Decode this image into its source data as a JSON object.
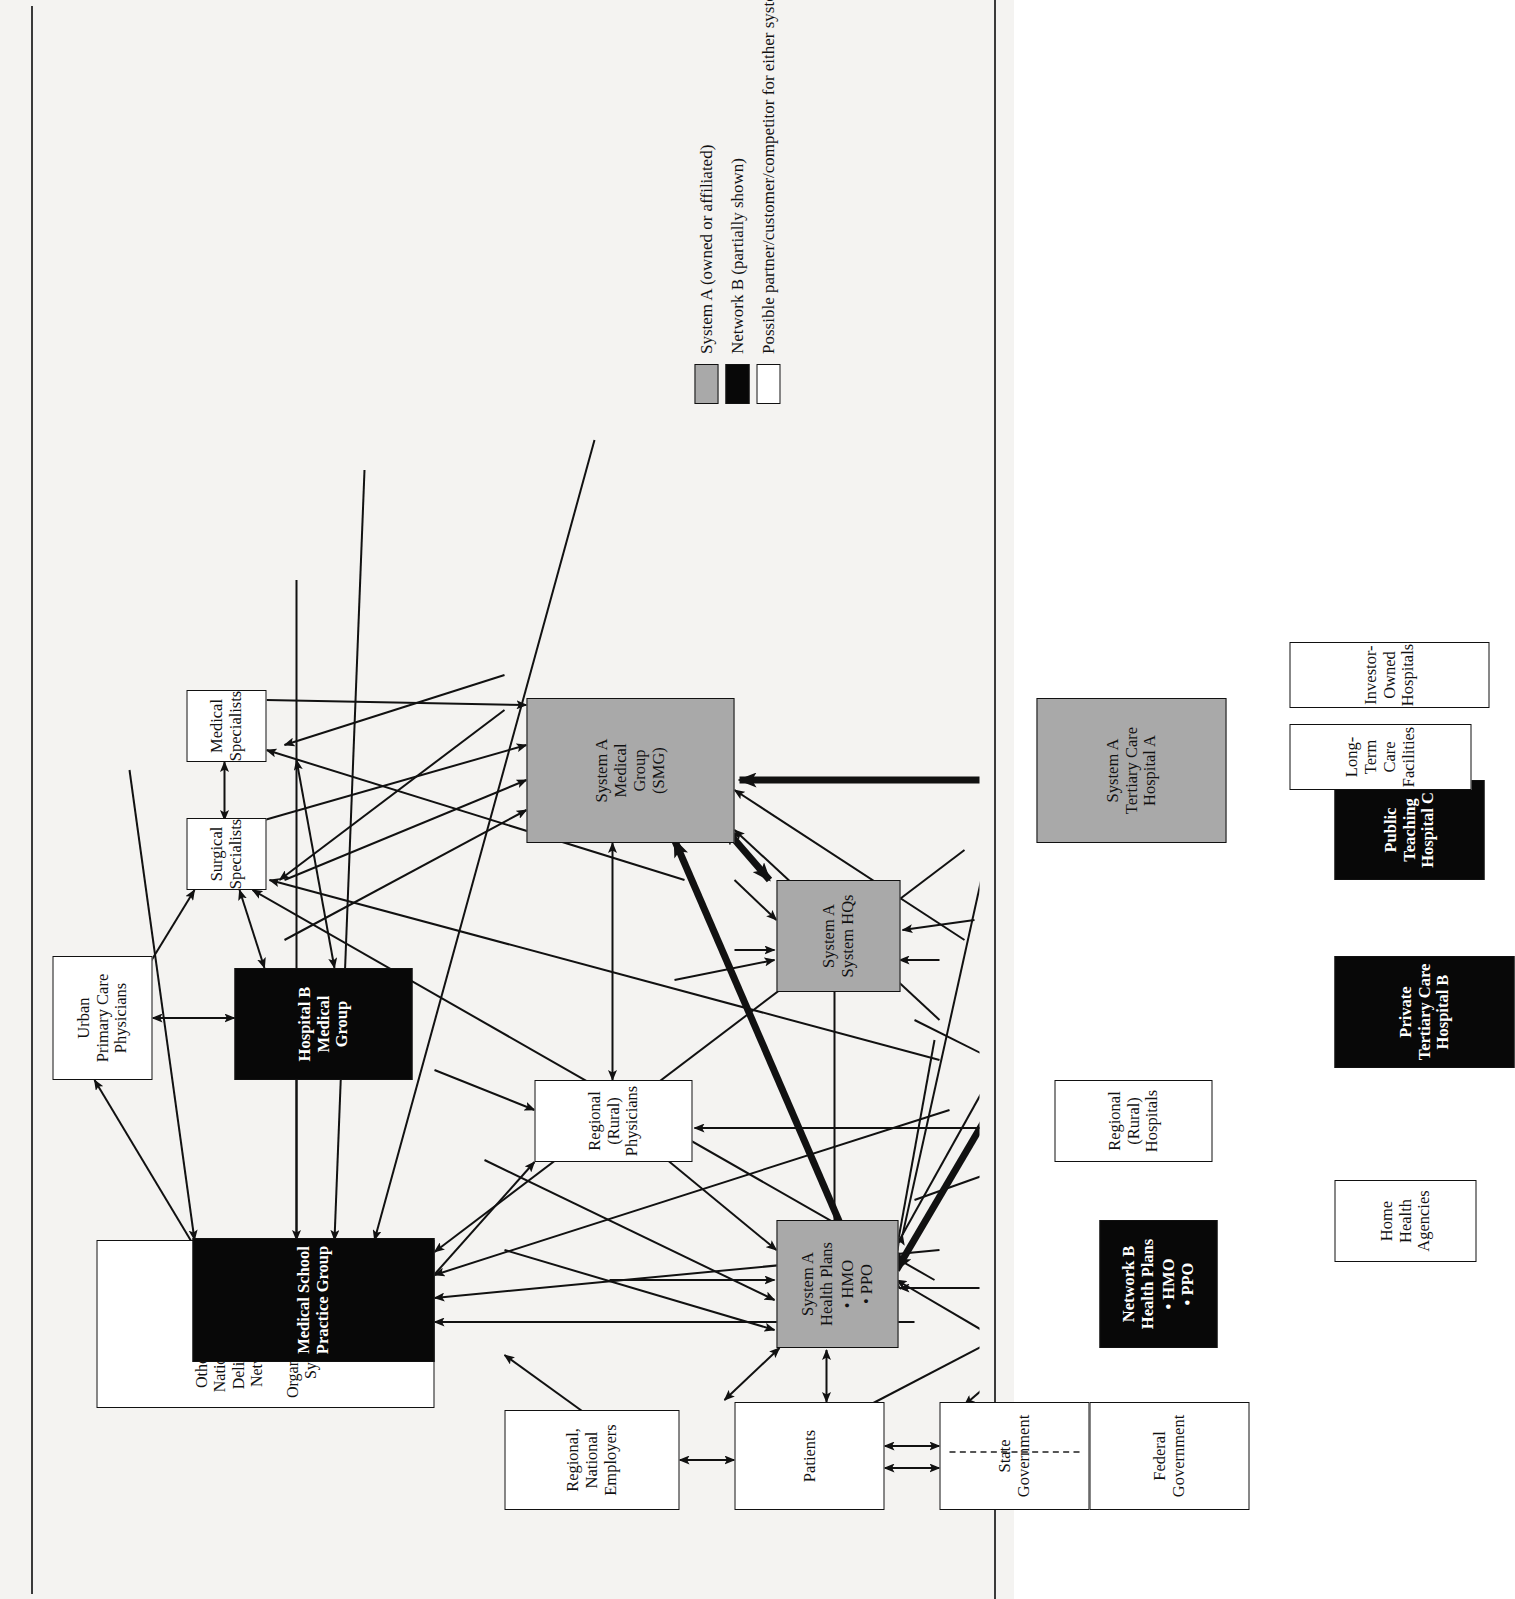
{
  "figure": {
    "colors": {
      "system_a_fill": "#a9a9a9",
      "network_b_fill": "#080808",
      "other_fill": "#ffffff",
      "line": "#111111"
    },
    "nodes": [
      {
        "id": "other-idn",
        "kind": "white",
        "label": "Other Regionally or Nationally\nIntegrated Delivery Systems\nor Networks/Managed Care\nOrganizations/Hospital\nSystems/Medical Groups"
      },
      {
        "id": "medical-school",
        "kind": "black",
        "label": "Medical School\nPractice Group"
      },
      {
        "id": "urban-pcp",
        "kind": "white",
        "label": "Urban\nPrimary Care\nPhysicians"
      },
      {
        "id": "surgical-specialists",
        "kind": "white",
        "label": "Surgical\nSpecialists"
      },
      {
        "id": "medical-specialists",
        "kind": "white",
        "label": "Medical\nSpecialists"
      },
      {
        "id": "hospital-b-group",
        "kind": "black",
        "label": "Hospital B\nMedical\nGroup"
      },
      {
        "id": "regional-physicians",
        "kind": "white",
        "label": "Regional\n(Rural)\nPhysicians"
      },
      {
        "id": "smg",
        "kind": "gray",
        "label": "System A\nMedical\nGroup\n(SMG)"
      },
      {
        "id": "employers",
        "kind": "white",
        "label": "Regional,\nNational\nEmployers"
      },
      {
        "id": "patients",
        "kind": "white",
        "label": "Patients"
      },
      {
        "id": "state-government",
        "kind": "white",
        "label": "State\nGovernment"
      },
      {
        "id": "federal-government",
        "kind": "white",
        "label": "Federal\nGovernment"
      },
      {
        "id": "system-a-health-plans",
        "kind": "gray",
        "label": "System A\nHealth Plans",
        "bullets": [
          "HMO",
          "PPO"
        ]
      },
      {
        "id": "network-b-health-plans",
        "kind": "black",
        "label": "Network B\nHealth Plans",
        "bullets": [
          "HMO",
          "PPO"
        ]
      },
      {
        "id": "system-a-hq",
        "kind": "gray",
        "label": "System A\nSystem HQs"
      },
      {
        "id": "regional-hospitals",
        "kind": "white",
        "label": "Regional\n(Rural)\nHospitals"
      },
      {
        "id": "tertiary-a",
        "kind": "gray",
        "label": "System A\nTertiary Care\nHospital A"
      },
      {
        "id": "home-health",
        "kind": "white",
        "label": "Home\nHealth\nAgencies"
      },
      {
        "id": "private-tertiary-b",
        "kind": "black",
        "label": "Private\nTertiary Care\nHospital B"
      },
      {
        "id": "public-teaching-c",
        "kind": "black",
        "label": "Public\nTeaching\nHospital C"
      },
      {
        "id": "long-term-care",
        "kind": "white",
        "label": "Long-Term\nCare Facilities"
      },
      {
        "id": "investor-hospitals",
        "kind": "white",
        "label": "Investor-Owned\nHospitals"
      }
    ],
    "legend": {
      "items": [
        {
          "swatch": "gray",
          "text": "System A (owned or affiliated)"
        },
        {
          "swatch": "black",
          "text": "Network B (partially shown)"
        },
        {
          "swatch": "white",
          "text": "Possible partner/customer/competitor for either system/network"
        }
      ]
    }
  },
  "nodes_text": {
    "other_idn": "Other Regionally or Nationally Integrated Delivery Systems or Networks/Managed Care Organizations/Hospital Systems/Medical Groups",
    "medical_school_l1": "Medical School",
    "medical_school_l2": "Practice Group",
    "urban_pcp_l1": "Urban",
    "urban_pcp_l2": "Primary Care",
    "urban_pcp_l3": "Physicians",
    "surgical_l1": "Surgical",
    "surgical_l2": "Specialists",
    "medspec_l1": "Medical",
    "medspec_l2": "Specialists",
    "hospb_l1": "Hospital B",
    "hospb_l2": "Medical",
    "hospb_l3": "Group",
    "regphys_l1": "Regional",
    "regphys_l2": "(Rural)",
    "regphys_l3": "Physicians",
    "smg_l1": "System A",
    "smg_l2": "Medical",
    "smg_l3": "Group",
    "smg_l4": "(SMG)",
    "employers_l1": "Regional,",
    "employers_l2": "National",
    "employers_l3": "Employers",
    "patients_l1": "Patients",
    "stategov_l1": "State",
    "stategov_l2": "Government",
    "fedgov_l1": "Federal",
    "fedgov_l2": "Government",
    "sahp_l1": "System A",
    "sahp_l2": "Health Plans",
    "sahp_b1": "HMO",
    "sahp_b2": "PPO",
    "nbhp_l1": "Network B",
    "nbhp_l2": "Health Plans",
    "nbhp_b1": "HMO",
    "nbhp_b2": "PPO",
    "sahq_l1": "System A",
    "sahq_l2": "System HQs",
    "reghosp_l1": "Regional",
    "reghosp_l2": "(Rural)",
    "reghosp_l3": "Hospitals",
    "tert_l1": "System A",
    "tert_l2": "Tertiary Care",
    "tert_l3": "Hospital A",
    "home_l1": "Home",
    "home_l2": "Health",
    "home_l3": "Agencies",
    "privb_l1": "Private",
    "privb_l2": "Tertiary Care",
    "privb_l3": "Hospital B",
    "pubc_l1": "Public",
    "pubc_l2": "Teaching",
    "pubc_l3": "Hospital C",
    "ltc_l1": "Long-Term",
    "ltc_l2": "Care Facilities",
    "inv_l1": "Investor-Owned",
    "inv_l2": "Hospitals"
  },
  "legend_text": {
    "item1": "System A (owned or affiliated)",
    "item2": "Network B (partially shown)",
    "item3": "Possible partner/customer/competitor for either system/network"
  }
}
